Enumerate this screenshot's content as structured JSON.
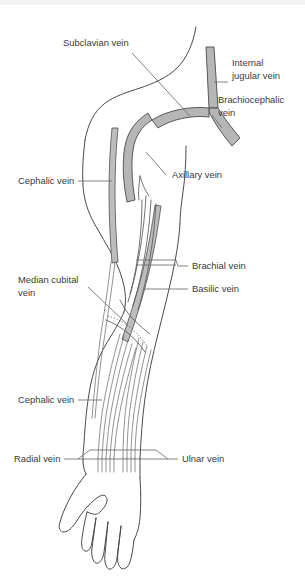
{
  "figure": {
    "background_color": "#ffffff",
    "vessel_fill_color": "#b6b6b6",
    "outline_color": "#4a4a4a",
    "label_color": "#3a3a3a",
    "leader_color": "#6e6e6e"
  },
  "labels": {
    "subclavian_vein": "Subclavian vein",
    "internal_jugular_vein_line1": "Internal",
    "internal_jugular_vein_line2": "jugular vein",
    "brachiocephalic_vein_line1": "Brachiocephalic",
    "brachiocephalic_vein_line2": "vein",
    "axillary_vein": "Axillary vein",
    "cephalic_vein_upper": "Cephalic vein",
    "brachial_vein": "Brachial vein",
    "basilic_vein": "Basilic vein",
    "median_cubital_vein_line1": "Median cubital",
    "median_cubital_vein_line2": "vein",
    "cephalic_vein_lower": "Cephalic vein",
    "radial_vein": "Radial vein",
    "ulnar_vein": "Ulnar vein"
  }
}
